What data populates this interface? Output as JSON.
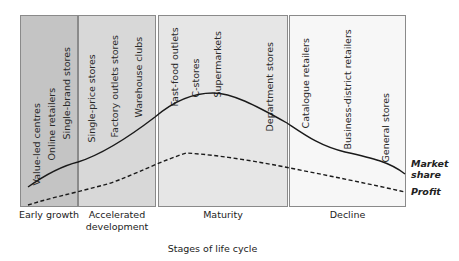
{
  "diagram": {
    "type": "life-cycle",
    "x_axis_title": "Stages of life cycle",
    "stages": [
      {
        "name": "Early growth",
        "fill": "#c4c4c4",
        "retailers": [
          "Value-led centres",
          "Online retailers",
          "Single-brand stores"
        ]
      },
      {
        "name": "Accelerated development",
        "name_lines": [
          "Accelerated",
          "development"
        ],
        "fill": "#d8d8d8",
        "retailers": [
          "Single-price stores",
          "Factory outlets stores",
          "Warehouse clubs"
        ]
      },
      {
        "name": "Maturity",
        "fill": "#e6e6e6",
        "retailers": [
          "Fast-food outlets",
          "C-stores",
          "Supermarkets",
          "Department stores"
        ]
      },
      {
        "name": "Decline",
        "fill": "#f7f7f7",
        "retailers": [
          "Catalogue retailers",
          "Business-district retailers",
          "General stores"
        ]
      }
    ],
    "series": [
      {
        "name": "Market share",
        "name_lines": [
          "Market",
          "share"
        ],
        "style": "solid"
      },
      {
        "name": "Profit",
        "style": "dashed"
      }
    ]
  }
}
